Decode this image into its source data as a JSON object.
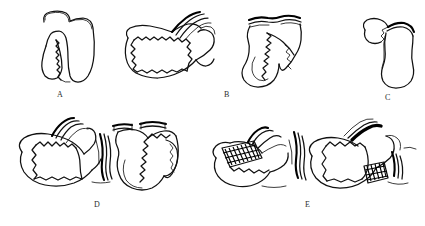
{
  "figure": {
    "kind": "line-drawing",
    "background_color": "#ffffff",
    "ink_color": "#111111",
    "width": 425,
    "height": 226,
    "caption": "",
    "panels": [
      {
        "id": "A",
        "label": "A",
        "label_x": 60,
        "label_y": 96,
        "row": 1,
        "drawings": [
          {
            "name": "organ-outline-with-wedge",
            "description": "tubular organ outline with a separated wedge-shaped flap and serrated resection edge",
            "x": 30,
            "y": 8,
            "width": 70,
            "height": 78
          },
          {
            "name": "mobilized-flap-with-pedicle",
            "description": "flap folded over with serrated suture edge and striped vascular pedicle at upper right",
            "x": 120,
            "y": 12,
            "width": 98,
            "height": 68
          }
        ]
      },
      {
        "id": "B",
        "label": "B",
        "label_x": 227,
        "label_y": 96,
        "row": 1,
        "drawings": [
          {
            "name": "organ-with-serrated-incision",
            "description": "flask-shaped organ with double clamp bars across the top and a long serrated incision line",
            "x": 228,
            "y": 8,
            "width": 76,
            "height": 80
          }
        ]
      },
      {
        "id": "C",
        "label": "C",
        "label_x": 388,
        "label_y": 99,
        "row": 1,
        "drawings": [
          {
            "name": "closed-organ-with-stump",
            "description": "closed flask-shaped organ with a small triangular stump at the upper left",
            "x": 352,
            "y": 12,
            "width": 68,
            "height": 76
          }
        ]
      },
      {
        "id": "D",
        "label": "D",
        "label_x": 97,
        "label_y": 206,
        "row": 2,
        "drawings": [
          {
            "name": "lateral-view-anastomosis",
            "description": "lateral view of rounded organ with serrated anastomosis line and bundled tubular structures at right",
            "x": 12,
            "y": 124,
            "width": 96,
            "height": 72
          },
          {
            "name": "frontal-view-clamped-anastomosis",
            "description": "frontal view with two clamp bars on top, serrated anastomosis line down the middle and a lateral pouch",
            "x": 104,
            "y": 120,
            "width": 80,
            "height": 80
          }
        ]
      },
      {
        "id": "E",
        "label": "E",
        "label_x": 308,
        "label_y": 206,
        "row": 2,
        "drawings": [
          {
            "name": "anastomosis-with-hatched-graft-left",
            "description": "organ with a dark cross-hatched rectangular graft patch on the left and banded tubes at the right",
            "x": 212,
            "y": 128,
            "width": 98,
            "height": 70
          },
          {
            "name": "anastomosis-with-hatched-graft-right",
            "description": "organ with thick dark band across the top and a small cross-hatched graft patch at lower right",
            "x": 308,
            "y": 128,
            "width": 106,
            "height": 70
          }
        ]
      }
    ]
  }
}
